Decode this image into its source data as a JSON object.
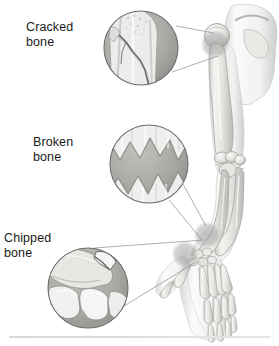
{
  "figure": {
    "background_color": "#ffffff",
    "width": 279,
    "height": 346,
    "style": "grayscale medical illustration",
    "anatomy_subject": "right arm skeleton with shoulder, elbow, wrist and hand"
  },
  "labels": {
    "cracked": "Cracked\nbone",
    "broken": "Broken\nbone",
    "chipped": "Chipped\nbone"
  },
  "callouts": [
    {
      "id": "cracked",
      "label": "Cracked\nbone",
      "inset_content": "hairline diagonal crack across bone shaft",
      "circle": {
        "cx": 141,
        "cy": 48,
        "r": 37
      },
      "anchor": {
        "x": 218,
        "y": 38
      },
      "anchor_region": "shoulder / humeral head"
    },
    {
      "id": "broken",
      "label": "Broken\nbone",
      "inset_content": "complete fracture with jagged separated bone ends",
      "circle": {
        "cx": 149,
        "cy": 164,
        "r": 39
      },
      "anchor": {
        "x": 212,
        "y": 232
      },
      "anchor_region": "forearm / radius shaft"
    },
    {
      "id": "chipped",
      "label": "Chipped\nbone",
      "inset_content": "chipped fragment broken off a carpal bone",
      "circle": {
        "cx": 88,
        "cy": 288,
        "r": 40
      },
      "anchor": {
        "x": 205,
        "y": 243
      },
      "anchor_region": "wrist / carpal bones"
    }
  ],
  "highlight_markers": [
    {
      "region": "shoulder",
      "cx": 215,
      "cy": 44,
      "r": 14
    },
    {
      "region": "forearm",
      "cx": 207,
      "cy": 235,
      "r": 13
    },
    {
      "region": "wrist",
      "cx": 185,
      "cy": 254,
      "r": 13
    }
  ],
  "colors": {
    "background": "#ffffff",
    "text": "#1b1b1b",
    "bone_light": "#f2f2f0",
    "bone_mid": "#d9d9d6",
    "bone_shadow": "#a8a8a6",
    "inset_fill": "#a9a9a7",
    "inset_border": "#6e6e6e",
    "leader_line": "#8d8d8d",
    "outline": "#9a9a98",
    "highlight": "#9b9b99",
    "footer_rule": "#dcdee0"
  },
  "footer": {
    "separator_visible": true
  }
}
